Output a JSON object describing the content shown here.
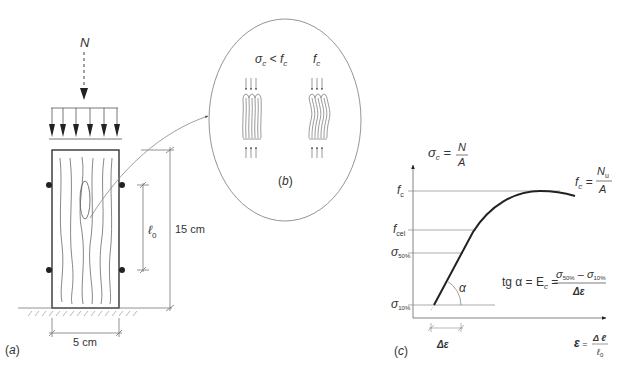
{
  "panel_a": {
    "caption": "(a)",
    "load_label": "N",
    "height_dim": "15 cm",
    "width_dim": "5 cm",
    "gauge_length_label": "ℓ",
    "gauge_length_sub": "0"
  },
  "panel_b": {
    "caption": "(b)",
    "left_label_sigma": "σ",
    "left_label_sub": "c",
    "left_label_rel": " < f",
    "left_label_rel_sub": "c",
    "right_label": "f",
    "right_label_sub": "c"
  },
  "panel_c": {
    "caption": "(c)",
    "y_axis": {
      "sym": "σ",
      "sub": "c",
      "eq": " = ",
      "num": "N",
      "den": "A"
    },
    "peak": {
      "sym": "f",
      "sub": "c",
      "eq": " = ",
      "num": "N",
      "num_sub": "u",
      "den": "A"
    },
    "ticks": [
      {
        "sym": "f",
        "sub": "c"
      },
      {
        "sym": "f",
        "sub": "cel"
      },
      {
        "sym": "σ",
        "sub": "50%"
      },
      {
        "sym": "σ",
        "sub": "10%"
      }
    ],
    "angle": "α",
    "delta_eps": "Δε",
    "modulus": {
      "lhs": "tg α = E",
      "lhs_sub": "c",
      "eq": " = ",
      "num_a": "σ",
      "num_a_sub": "50%",
      "minus": " – ",
      "num_b": "σ",
      "num_b_sub": "10%",
      "den": "Δε"
    },
    "x_axis": {
      "sym": "ε",
      "eq": " = ",
      "num": "Δ ℓ",
      "den": "ℓ",
      "den_sub": "0"
    }
  },
  "colors": {
    "line": "#333333",
    "thin": "#777777",
    "bg": "#ffffff"
  }
}
